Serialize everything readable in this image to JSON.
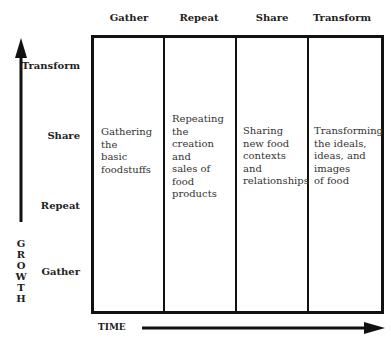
{
  "columns": [
    "Gather",
    "Repeat",
    "Share",
    "Transform"
  ],
  "rows": [
    "Transform",
    "Share",
    "Repeat",
    "Gather"
  ],
  "cells": [
    [
      "Gathering",
      "the",
      "basic",
      "foodstuffs"
    ],
    [
      "Repeating",
      "the",
      "creation",
      "and",
      "sales of",
      "food",
      "products"
    ],
    [
      "Sharing",
      "new food",
      "contexts",
      "and",
      "relationships"
    ],
    [
      "Transforming",
      "the ideals,",
      "ideas, and",
      "images",
      "of food"
    ]
  ],
  "y_axis_label": [
    "G",
    "R",
    "O",
    "W",
    "T",
    "H"
  ],
  "x_axis_label": "TIME"
}
